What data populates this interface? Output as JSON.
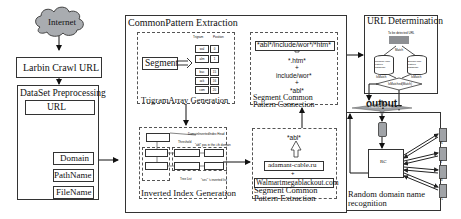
{
  "internet": {
    "label": "Internet"
  },
  "larbin": {
    "label": "Larbin Crawl URL"
  },
  "dataset": {
    "title": "DataSet Preprocessing",
    "url": "URL",
    "fields": [
      "Domain",
      "PathName",
      "FileName"
    ]
  },
  "common_pattern": {
    "title": "CommonPattern Extraction",
    "trigram": {
      "segment": "Segment",
      "caption": "TrigramArray Generation",
      "col_headers": [
        "Trigram",
        "Position"
      ],
      "rows_top": [
        [
          "wal",
          "0"
        ],
        [
          "alm",
          "1"
        ]
      ],
      "rows_bottom": [
        [
          "bac",
          "15"
        ],
        [
          "ack",
          "16"
        ],
        [
          "com",
          "20"
        ]
      ]
    },
    "inverted": {
      "caption": "Inverted Index Generation",
      "head_label": "DomainInvertedIndex Head",
      "threshold_label": "Threshold",
      "pos_label": "\"abl\" pos in the i-th domain",
      "tree_label": "Tree List",
      "inverted_label": "\"ses\" 's inverted list"
    },
    "connection": {
      "caption_line1": "Segment Common",
      "caption_line2": "Pattern Connection",
      "result": "*abl*/include/wor*/*htm*",
      "parts": [
        "*.htm*",
        "+",
        "include/wor*",
        "+",
        "*abl*"
      ]
    },
    "extraction": {
      "caption_line1": "Segment Common",
      "caption_line2": "Pattern Extraction",
      "pattern": "*abl*",
      "domain1": "adamant-cable.ru",
      "plus": "+",
      "domain2": "Walmartmegablackout.com"
    }
  },
  "url_determination": {
    "title": "URL Determination",
    "input_label": "To be detected URL",
    "split_label": "Match",
    "db_left": "Random URL pattern database",
    "db_right": "Benign URL pattern database",
    "left_flag": "IsMatch",
    "right_flag": "IsMatch",
    "decision": "IsMatched(Match)"
  },
  "output": {
    "label": "output"
  },
  "random_recognition": {
    "title_line1": "Random domain name",
    "title_line2": "recognition",
    "classifier_label": "Feature Extraction",
    "rc_label": "RC",
    "servers": [
      "R",
      "T",
      "B",
      "A"
    ]
  },
  "colors": {
    "cloud_fill": "#a9acb0",
    "border": "#333333",
    "dashed": "#555555",
    "url_input": "#8d8f93"
  }
}
